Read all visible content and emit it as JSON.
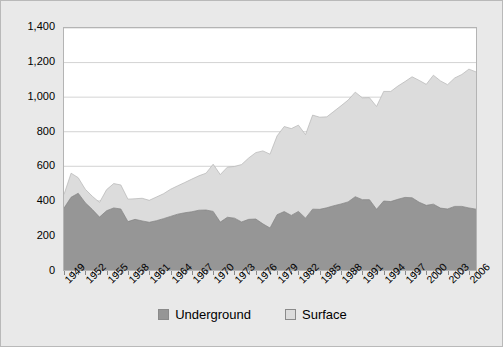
{
  "chart_data": {
    "type": "area",
    "stacked": true,
    "title": "",
    "subtitle": "",
    "xlabel": "",
    "ylabel": "",
    "ylim": [
      0,
      1400
    ],
    "y_ticks": [
      0,
      200,
      400,
      600,
      800,
      1000,
      1200,
      1400
    ],
    "y_tick_labels": [
      "0",
      "200",
      "400",
      "600",
      "800",
      "1,000",
      "1,200",
      "1,400"
    ],
    "grid": true,
    "legend_position": "bottom",
    "x_tick_labels": [
      "1949",
      "1952",
      "1955",
      "1958",
      "1961",
      "1964",
      "1967",
      "1970",
      "1973",
      "1976",
      "1979",
      "1982",
      "1985",
      "1988",
      "1991",
      "1994",
      "1997",
      "2000",
      "2003",
      "2006"
    ],
    "x": [
      1949,
      1950,
      1951,
      1952,
      1953,
      1954,
      1955,
      1956,
      1957,
      1958,
      1959,
      1960,
      1961,
      1962,
      1963,
      1964,
      1965,
      1966,
      1967,
      1968,
      1969,
      1970,
      1971,
      1972,
      1973,
      1974,
      1975,
      1976,
      1977,
      1978,
      1979,
      1980,
      1981,
      1982,
      1983,
      1984,
      1985,
      1986,
      1987,
      1988,
      1989,
      1990,
      1991,
      1992,
      1993,
      1994,
      1995,
      1996,
      1997,
      1998,
      1999,
      2000,
      2001,
      2002,
      2003,
      2004,
      2005,
      2006,
      2007
    ],
    "series": [
      {
        "name": "Underground",
        "color": "#969696",
        "values": [
          358,
          421,
          444,
          389,
          350,
          306,
          343,
          359,
          353,
          280,
          293,
          284,
          276,
          285,
          297,
          310,
          323,
          331,
          337,
          346,
          347,
          339,
          277,
          305,
          300,
          278,
          293,
          295,
          267,
          243,
          320,
          338,
          316,
          339,
          300,
          352,
          351,
          360,
          372,
          382,
          394,
          424,
          407,
          407,
          351,
          399,
          396,
          409,
          420,
          418,
          392,
          374,
          381,
          358,
          353,
          368,
          368,
          359,
          352
        ]
      },
      {
        "name": "Surface",
        "color": "#dcdcdc",
        "values": [
          79,
          139,
          90,
          78,
          76,
          85,
          122,
          141,
          139,
          130,
          119,
          131,
          127,
          137,
          144,
          157,
          164,
          175,
          189,
          199,
          213,
          273,
          275,
          290,
          299,
          332,
          355,
          384,
          422,
          427,
          456,
          492,
          502,
          499,
          483,
          544,
          533,
          526,
          546,
          568,
          589,
          605,
          589,
          590,
          595,
          634,
          637,
          655,
          670,
          700,
          705,
          700,
          746,
          736,
          719,
          743,
          763,
          803,
          794
        ]
      }
    ],
    "totals_note": ""
  },
  "legend": {
    "items": [
      {
        "label": "Underground",
        "swatch": "#969696"
      },
      {
        "label": "Surface",
        "swatch": "#dcdcdc"
      }
    ]
  },
  "colors": {
    "underground": "#969696",
    "surface": "#dcdcdc",
    "plot_background": "#ffffff",
    "frame_background": "#e9e9e9",
    "gridline": "#c8c8c8",
    "axis": "#8a8a8a"
  }
}
